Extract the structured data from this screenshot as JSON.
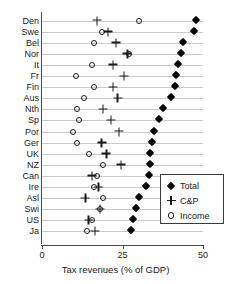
{
  "chart_data": {
    "type": "scatter",
    "title": "",
    "xlabel": "Tax revenues (% of GDP)",
    "ylabel": "",
    "xlim": [
      0,
      50
    ],
    "xticks": [
      0,
      25,
      50
    ],
    "xtick_labels": [
      "0",
      "25",
      "50"
    ],
    "grid": true,
    "legend_position": "lower right",
    "categories": [
      "Den",
      "Swe",
      "Bel",
      "Nor",
      "It",
      "Fr",
      "Fin",
      "Aus",
      "Nth",
      "Sp",
      "Por",
      "Ger",
      "UK",
      "NZ",
      "Can",
      "Ire",
      "Asl",
      "Swi",
      "US",
      "Ja"
    ],
    "series": [
      {
        "name": "Total",
        "marker": "filled-diamond",
        "color": "#000000",
        "values": [
          48.0,
          47.5,
          44.0,
          43.5,
          42.5,
          42.0,
          41.5,
          40.5,
          38.0,
          36.5,
          35.0,
          34.5,
          34.0,
          34.0,
          33.5,
          32.5,
          30.5,
          29.5,
          28.5,
          28.0
        ]
      },
      {
        "name": "C&P",
        "marker": "plus",
        "color": "#1a1a1a",
        "values": [
          17.0,
          20.5,
          23.0,
          26.5,
          22.0,
          25.5,
          22.0,
          23.5,
          19.0,
          21.5,
          24.0,
          18.5,
          20.0,
          24.5,
          15.5,
          17.5,
          13.5,
          18.0,
          14.5,
          16.5
        ]
      },
      {
        "name": "Income",
        "marker": "open-circle",
        "color": "#1a1a1a",
        "values": [
          30.0,
          18.5,
          16.0,
          27.0,
          15.5,
          10.5,
          16.0,
          13.0,
          11.0,
          11.5,
          9.5,
          11.0,
          14.5,
          19.0,
          17.0,
          16.0,
          19.0,
          18.0,
          15.5,
          14.0
        ]
      }
    ]
  },
  "legend": {
    "entries": [
      {
        "label": "Total",
        "symbol": "filled-diamond"
      },
      {
        "label": "C&P",
        "symbol": "plus"
      },
      {
        "label": "Income",
        "symbol": "open-circle"
      }
    ]
  }
}
